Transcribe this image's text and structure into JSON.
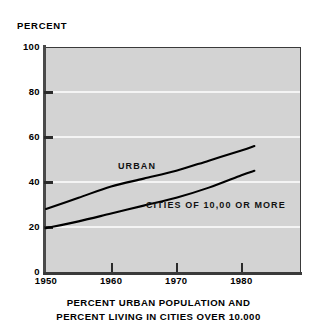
{
  "chart_data": {
    "type": "line",
    "title": "PERCENT URBAN POPULATION AND PERCENT LIVING IN CITIES OVER 10.000",
    "title_lines": [
      "PERCENT URBAN POPULATION AND",
      "PERCENT LIVING IN CITIES OVER 10.000"
    ],
    "xlabel": "",
    "ylabel": "PERCENT",
    "y_unit_label": "PERCENT",
    "xlim": [
      1950,
      1989
    ],
    "ylim": [
      0,
      100
    ],
    "grid": "horizontal-white",
    "legend_position": "inline-on-plot",
    "background_color": "#d3d3d3",
    "line_color": "#000000",
    "gridline_color": "#f4f4f4",
    "yticks": [
      0,
      20,
      40,
      60,
      80,
      100
    ],
    "ytick_labels": [
      "0",
      "20",
      "40",
      "60",
      "80",
      "100"
    ],
    "xticks": [
      1950,
      1960,
      1970,
      1980
    ],
    "xtick_labels": [
      "1950",
      "1960",
      "1970",
      "1980"
    ],
    "x": [
      1950,
      1955,
      1960,
      1965,
      1970,
      1975,
      1980,
      1982
    ],
    "series": [
      {
        "name": "URBAN",
        "label": "URBAN",
        "values": [
          28,
          33,
          38,
          41.5,
          45,
          49.5,
          54,
          56
        ]
      },
      {
        "name": "CITIES OF 10,00 OR MORE",
        "label": "CITIES OF 10,00 OR MORE",
        "values": [
          19.5,
          22.5,
          26,
          29.5,
          33,
          37.5,
          43,
          45
        ]
      }
    ]
  }
}
